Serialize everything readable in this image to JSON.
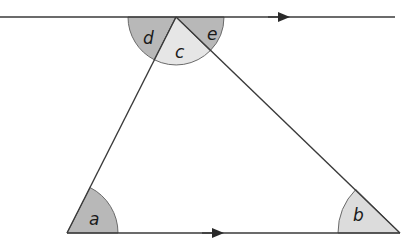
{
  "diagram": {
    "colors": {
      "line": "#3a3a3a",
      "dark_sector": "#b8b8b8",
      "light_sector": "#e6e6e6",
      "sector_stroke": "#6a6a6a",
      "background": "#ffffff"
    },
    "lines": {
      "top": {
        "x1": 0,
        "y1": 17,
        "x2": 395,
        "y2": 17,
        "arrow_at_x": 282
      },
      "bottom": {
        "x1": 67,
        "y1": 233,
        "x2": 400,
        "y2": 233,
        "arrow_at_x": 216
      }
    },
    "vertices": {
      "apex": {
        "x": 176,
        "y": 17
      },
      "bottom_left": {
        "x": 67,
        "y": 233
      },
      "bottom_right": {
        "x": 400,
        "y": 233
      }
    },
    "angles": [
      {
        "label": "a",
        "at": "bottom_left",
        "shade": "dark"
      },
      {
        "label": "b",
        "at": "bottom_right",
        "shade": "light"
      },
      {
        "label": "c",
        "at": "apex interior",
        "shade": "light"
      },
      {
        "label": "d",
        "at": "apex left exterior",
        "shade": "dark"
      },
      {
        "label": "e",
        "at": "apex right exterior",
        "shade": "dark"
      }
    ],
    "labels": {
      "a": "a",
      "b": "b",
      "c": "c",
      "d": "d",
      "e": "e"
    }
  }
}
